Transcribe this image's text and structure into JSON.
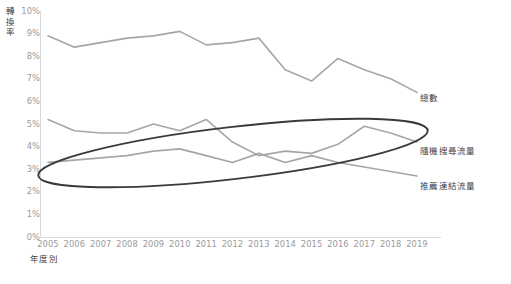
{
  "chart_data": {
    "type": "line",
    "title": "",
    "xlabel": "年度別",
    "ylabel": "轉換率",
    "x": [
      2005,
      2006,
      2007,
      2008,
      2009,
      2010,
      2011,
      2012,
      2013,
      2014,
      2015,
      2016,
      2017,
      2018,
      2019
    ],
    "categories": [
      "2005",
      "2006",
      "2007",
      "2008",
      "2009",
      "2010",
      "2011",
      "2012",
      "2013",
      "2014",
      "2015",
      "2016",
      "2017",
      "2018",
      "2019"
    ],
    "ylim": [
      0,
      10
    ],
    "yticks": [
      "0%",
      "1%",
      "2%",
      "3%",
      "4%",
      "5%",
      "6%",
      "7%",
      "8%",
      "9%",
      "10%"
    ],
    "ytick_values": [
      0,
      1,
      2,
      3,
      4,
      5,
      6,
      7,
      8,
      9,
      10
    ],
    "grid": false,
    "legend_position": "right-inline-labels",
    "series": [
      {
        "name": "總數",
        "color": "#a6a6a6",
        "values": [
          8.9,
          8.4,
          8.6,
          8.8,
          8.9,
          9.1,
          8.5,
          8.6,
          8.8,
          7.4,
          6.9,
          7.9,
          7.4,
          7.0,
          6.4
        ]
      },
      {
        "name": "隨機搜尋流量",
        "color": "#a6a6a6",
        "values": [
          5.2,
          4.7,
          4.6,
          4.6,
          5.0,
          4.7,
          5.2,
          4.2,
          3.6,
          3.8,
          3.7,
          4.1,
          4.9,
          4.6,
          4.2
        ]
      },
      {
        "name": "推薦連結流量",
        "color": "#a6a6a6",
        "values": [
          3.3,
          3.4,
          3.5,
          3.6,
          3.8,
          3.9,
          3.6,
          3.3,
          3.7,
          3.3,
          3.6,
          3.3,
          3.1,
          2.9,
          2.7
        ]
      }
    ],
    "annotations": [
      {
        "type": "ellipse",
        "name": "highlight-ellipse",
        "color": "#3a3a3a",
        "note": "hand-drawn tilted ellipse highlighting the two lower traffic series"
      }
    ]
  },
  "axis": {
    "y_title_chars": "轉\n換\n率",
    "x_title": "年度別"
  },
  "colors": {
    "line": "#a6a6a6",
    "annotation": "#3a3a3a",
    "tick_text": "#9a9a9a",
    "label_text": "#3f3f3f",
    "axis_line": "#d9d9d9"
  }
}
